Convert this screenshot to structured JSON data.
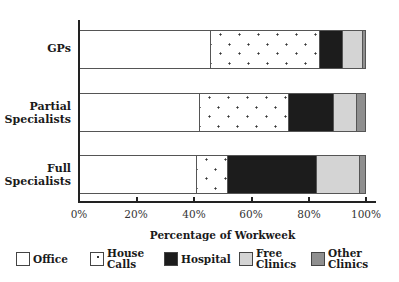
{
  "chart_data": {
    "type": "bar",
    "orientation": "horizontal",
    "stacked": true,
    "title": "",
    "xlabel": "Percentage of Workweek",
    "ylabel": "",
    "xlim": [
      0,
      100
    ],
    "x_ticks": [
      "0%",
      "20%",
      "40%",
      "60%",
      "80%",
      "100%"
    ],
    "grid": false,
    "legend_position": "bottom",
    "categories": [
      "GPs",
      "Partial Specialists",
      "Full Specialists"
    ],
    "series": [
      {
        "name": "Office",
        "color": "#ffffff",
        "pattern": "none",
        "values": [
          46,
          42,
          41
        ]
      },
      {
        "name": "House Calls",
        "color": "#ffffff",
        "pattern": "dots",
        "values": [
          38,
          31,
          11
        ]
      },
      {
        "name": "Hospital",
        "color": "#1c1c1c",
        "pattern": "none",
        "values": [
          8,
          16,
          31
        ]
      },
      {
        "name": "Free Clinics",
        "color": "#d4d4d4",
        "pattern": "none",
        "values": [
          7,
          8,
          15
        ]
      },
      {
        "name": "Other Clinics",
        "color": "#8f8f8f",
        "pattern": "none",
        "values": [
          1,
          3,
          2
        ]
      }
    ]
  },
  "labels": {
    "categories": [
      "GPs",
      "Partial\nSpecialists",
      "Full\nSpecialists"
    ],
    "ticks": [
      "0%",
      "20%",
      "40%",
      "60%",
      "80%",
      "100%"
    ],
    "xlabel": "Percentage of Workweek",
    "legend": [
      "Office",
      "House\nCalls",
      "Hospital",
      "Free\nClinics",
      "Other\nClinics"
    ]
  }
}
